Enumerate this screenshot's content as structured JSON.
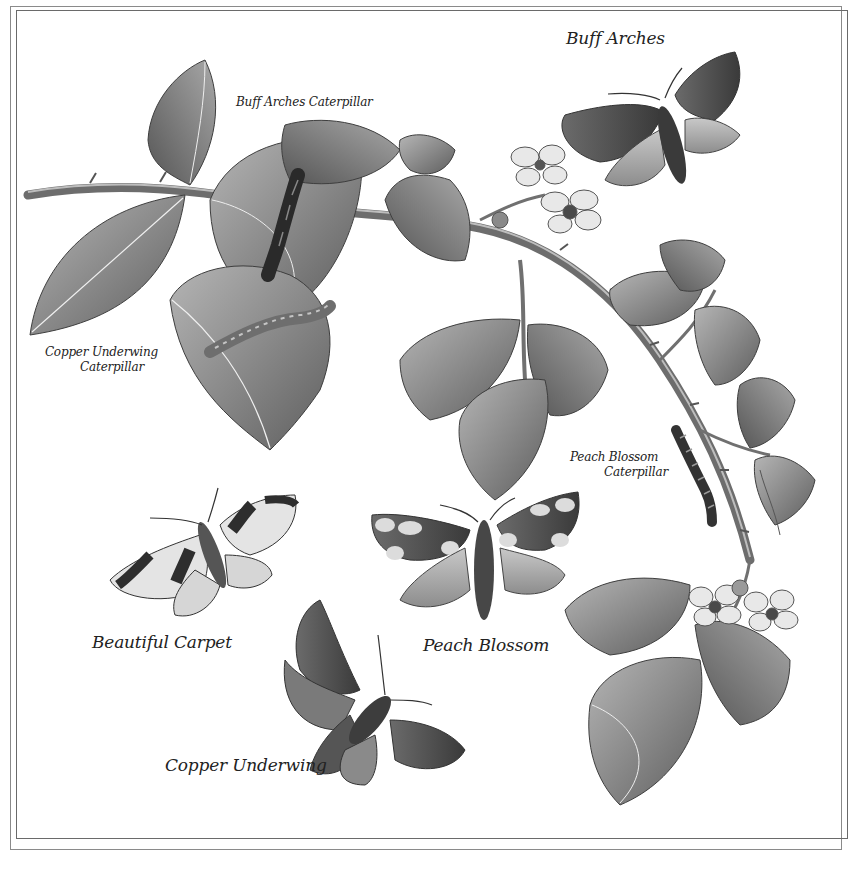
{
  "plate": {
    "title": "Moths and caterpillars on bramble",
    "colors": {
      "background": "#ffffff",
      "ink": "#222222",
      "leaf": "#8c8c8c",
      "leaf_dark": "#5a5a5a",
      "frame": "#7a7a7a"
    }
  },
  "labels": {
    "buff_arches": "Buff Arches",
    "buff_arches_caterpillar": "Buff Arches Caterpillar",
    "copper_underwing_caterpillar_line1": "Copper Underwing",
    "copper_underwing_caterpillar_line2": "Caterpillar",
    "peach_blossom_caterpillar_line1": "Peach Blossom",
    "peach_blossom_caterpillar_line2": "Caterpillar",
    "beautiful_carpet": "Beautiful Carpet",
    "peach_blossom": "Peach Blossom",
    "copper_underwing": "Copper Underwing"
  },
  "specimens": [
    {
      "name": "Buff Arches",
      "type": "moth"
    },
    {
      "name": "Buff Arches Caterpillar",
      "type": "caterpillar"
    },
    {
      "name": "Copper Underwing Caterpillar",
      "type": "caterpillar"
    },
    {
      "name": "Peach Blossom Caterpillar",
      "type": "caterpillar"
    },
    {
      "name": "Beautiful Carpet",
      "type": "moth"
    },
    {
      "name": "Peach Blossom",
      "type": "moth"
    },
    {
      "name": "Copper Underwing",
      "type": "moth"
    }
  ]
}
